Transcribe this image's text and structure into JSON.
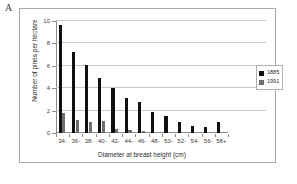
{
  "panel": {
    "label": "A"
  },
  "legend": {
    "position": "right",
    "entries": [
      {
        "label": "1885",
        "color": "#111111"
      },
      {
        "label": "1991",
        "color": "#6e6e6e"
      }
    ]
  },
  "axes": {
    "y_ticks": [
      "0",
      "2",
      "4",
      "6",
      "8",
      "10"
    ],
    "y_title": "Number of pines per hectare",
    "x_title": "Diameter at breast height (cm)",
    "x_ticks": [
      "34-",
      "36-",
      "38-",
      "40-",
      "42-",
      "44-",
      "46-",
      "48-",
      "50-",
      "52-",
      "54-",
      "56-",
      "58+"
    ]
  },
  "chart_data": {
    "type": "bar",
    "title": "",
    "subtitle": "",
    "xlabel": "Diameter at breast height (cm)",
    "ylabel": "Number of pines per hectare",
    "categories": [
      "34-",
      "36-",
      "38-",
      "40-",
      "42-",
      "44-",
      "46-",
      "48-",
      "50-",
      "52-",
      "54-",
      "56-",
      "58+"
    ],
    "series": [
      {
        "name": "1885",
        "color": "#111111",
        "values": [
          9.6,
          7.2,
          6.1,
          4.9,
          4.0,
          3.1,
          2.8,
          1.9,
          1.5,
          1.0,
          0.6,
          0.5,
          1.0
        ]
      },
      {
        "name": "1991",
        "color": "#6e6e6e",
        "values": [
          1.75,
          1.2,
          1.0,
          1.05,
          0.4,
          0.25,
          0.15,
          0,
          0,
          0,
          0,
          0,
          0
        ]
      }
    ],
    "ylim": [
      0,
      10
    ],
    "ytick_step": 2,
    "grid": true,
    "grid_axis": "y",
    "legend_position": "right"
  }
}
